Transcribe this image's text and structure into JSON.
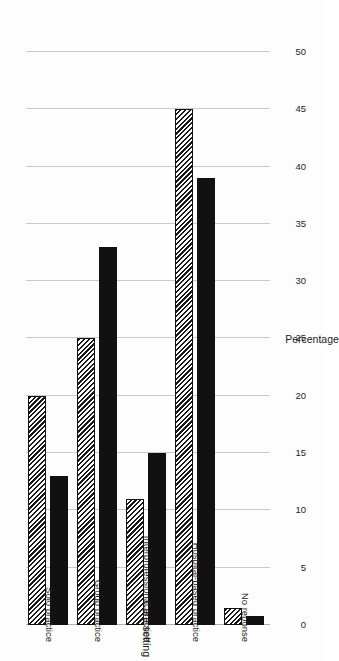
{
  "chart_data": {
    "type": "bar",
    "orientation": "horizontal",
    "title": "",
    "subtitle": "",
    "xlabel": "Care setting",
    "ylabel": "Percentage",
    "categories": [
      "Solo practice",
      "Group practice",
      "Interprofessional practice",
      "Hospital-based practice",
      "No reponse"
    ],
    "series": [
      {
        "name": "series-1",
        "style": "hatched",
        "values": [
          20,
          25,
          11,
          45,
          1.5
        ]
      },
      {
        "name": "series-2",
        "style": "solid",
        "values": [
          13,
          33,
          15,
          39,
          0.8
        ]
      }
    ],
    "ylim": [
      0,
      50
    ],
    "ytick_labels": [
      "0",
      "5",
      "10",
      "15",
      "20",
      "25",
      "30",
      "35",
      "40",
      "45",
      "50"
    ],
    "ytick_values": [
      0,
      5,
      10,
      15,
      20,
      25,
      30,
      35,
      40,
      45,
      50
    ],
    "grid": true,
    "legend": "none",
    "colors": {
      "solid_bar": "#111111",
      "hatch_bar_stroke": "#1a1a1a",
      "gridline": "#c9c9c9",
      "background": "#ffffff",
      "text": "#231f20"
    }
  }
}
